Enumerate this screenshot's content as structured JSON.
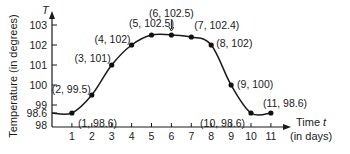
{
  "chart_data": {
    "type": "line",
    "title": "",
    "xlabel": "Time t (in days)",
    "xlabel_lines": [
      "Time t",
      "(in days)"
    ],
    "ylabel": "Temperature (in degrees)",
    "y_axis_symbol": "T",
    "x_axis_symbol": "t",
    "x_ticks": [
      1,
      2,
      3,
      4,
      5,
      6,
      7,
      8,
      9,
      10,
      11
    ],
    "y_ticks": [
      98,
      98.6,
      99,
      100,
      101,
      102,
      103
    ],
    "xlim": [
      0,
      11.5
    ],
    "ylim": [
      98,
      103.3
    ],
    "grid": false,
    "legend": null,
    "points": [
      {
        "x": 0,
        "y": 98.6,
        "label": ""
      },
      {
        "x": 1,
        "y": 98.6,
        "label": "(1, 98.6)"
      },
      {
        "x": 2,
        "y": 99.5,
        "label": "(2, 99.5)"
      },
      {
        "x": 3,
        "y": 101,
        "label": "(3, 101)"
      },
      {
        "x": 4,
        "y": 102,
        "label": "(4, 102)"
      },
      {
        "x": 5,
        "y": 102.5,
        "label": "(5, 102.5)"
      },
      {
        "x": 6,
        "y": 102.5,
        "label": "(6, 102.5)"
      },
      {
        "x": 7,
        "y": 102.4,
        "label": "(7, 102.4)"
      },
      {
        "x": 8,
        "y": 102,
        "label": "(8, 102)"
      },
      {
        "x": 9,
        "y": 100,
        "label": "(9, 100)"
      },
      {
        "x": 10,
        "y": 98.6,
        "label": "(10, 98.6)"
      },
      {
        "x": 11,
        "y": 98.6,
        "label": "(11, 98.6)"
      }
    ],
    "x": [
      1,
      2,
      3,
      4,
      5,
      6,
      7,
      8,
      9,
      10,
      11
    ],
    "series": [
      {
        "name": "Temperature",
        "values": [
          98.6,
          99.5,
          101,
          102,
          102.5,
          102.5,
          102.4,
          102,
          100,
          98.6,
          98.6
        ]
      }
    ],
    "annotations": [
      {
        "text": "(6, 102.5)",
        "note": "label with down arrow pointing to point"
      }
    ],
    "colors": {
      "line": "#1a1a1a",
      "point": "#111111",
      "axis": "#1a1a1a"
    }
  }
}
